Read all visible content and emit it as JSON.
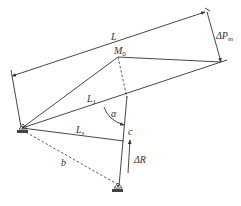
{
  "diagram": {
    "labels": {
      "L": "L",
      "M0": "M",
      "M0_sub": "0",
      "delta_Pm": "ΔP",
      "delta_Pm_sub": "m",
      "L1": "L",
      "L1_sub": "1",
      "Ls": "L",
      "Ls_sub": "s",
      "alpha": "α",
      "c": "c",
      "delta_R": "ΔR",
      "b": "b"
    },
    "colors": {
      "line": "#333333",
      "background": "#ffffff"
    }
  }
}
